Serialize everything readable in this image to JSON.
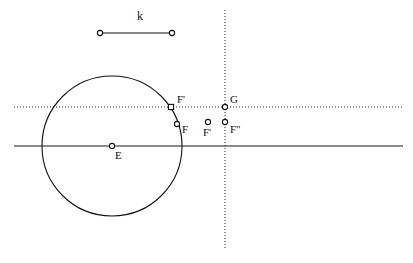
{
  "figure": {
    "background_color": "#ffffff",
    "stroke_color": "#111111",
    "width": 413,
    "height": 263,
    "segment": {
      "name": "k",
      "label": "k",
      "label_x": 137,
      "label_y": 13,
      "x1": 100,
      "y1": 33,
      "x2": 172,
      "y2": 33
    },
    "circle": {
      "center_label": "E",
      "cx": 112,
      "cy": 146,
      "r": 70
    },
    "lines": [
      {
        "name": "horizontal-solid-axis",
        "style": "solid",
        "x1": 14,
        "y1": 146,
        "x2": 403,
        "y2": 146
      },
      {
        "name": "horizontal-dotted-line",
        "style": "dotted",
        "x1": 14,
        "y1": 107,
        "x2": 403,
        "y2": 107
      },
      {
        "name": "vertical-dotted-line",
        "style": "dotted",
        "x1": 225,
        "y1": 10,
        "x2": 225,
        "y2": 250
      }
    ],
    "points": [
      {
        "id": "segment-endpoint-left",
        "label": "",
        "x": 100,
        "y": 33,
        "marker": "circle",
        "label_x": 0,
        "label_y": 0
      },
      {
        "id": "segment-endpoint-right",
        "label": "",
        "x": 172,
        "y": 33,
        "marker": "circle",
        "label_x": 0,
        "label_y": 0
      },
      {
        "id": "point-E",
        "label": "E",
        "x": 112,
        "y": 146,
        "marker": "circle",
        "label_x": 115,
        "label_y": 150
      },
      {
        "id": "point-F-prime-on-circle",
        "label": "F'",
        "x": 171,
        "y": 107,
        "marker": "square",
        "label_x": 177,
        "label_y": 94
      },
      {
        "id": "point-F",
        "label": "F",
        "x": 177,
        "y": 124,
        "marker": "circle",
        "label_x": 182,
        "label_y": 125
      },
      {
        "id": "point-F-prime-free",
        "label": "F'",
        "x": 208,
        "y": 122,
        "marker": "circle",
        "label_x": 203,
        "label_y": 127
      },
      {
        "id": "point-F-double-prime",
        "label": "F\"",
        "x": 225,
        "y": 122,
        "marker": "circle",
        "label_x": 230,
        "label_y": 125
      },
      {
        "id": "point-G",
        "label": "G",
        "x": 225,
        "y": 107,
        "marker": "circle",
        "label_x": 230,
        "label_y": 94
      }
    ]
  }
}
